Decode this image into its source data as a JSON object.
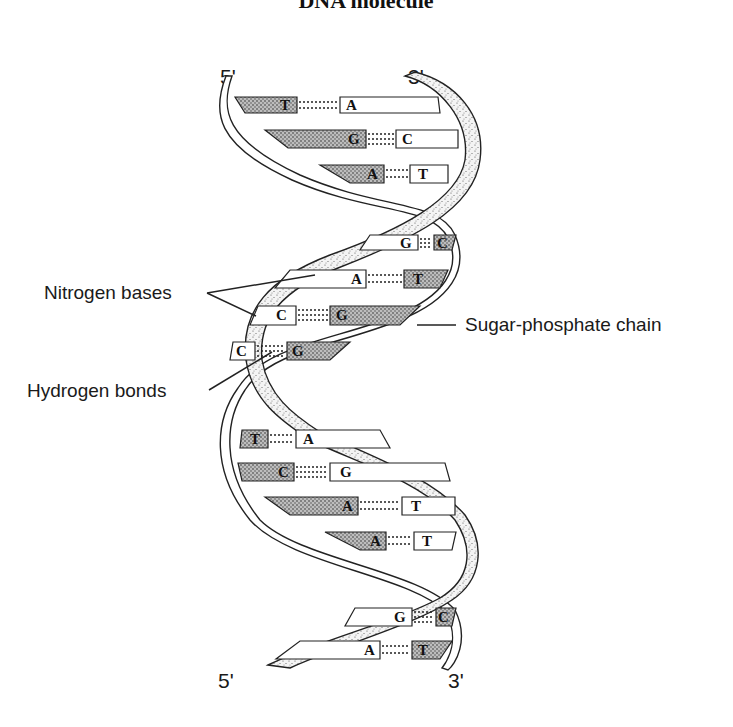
{
  "title": "DNA molecule",
  "ends": {
    "top_left": "5'",
    "top_right": "3'",
    "bottom_left": "5'",
    "bottom_right": "3'"
  },
  "labels": {
    "nitrogen_bases": "Nitrogen bases",
    "hydrogen_bonds": "Hydrogen bonds",
    "sugar_phosphate_chain": "Sugar-phosphate chain"
  },
  "base_pairs": [
    {
      "left": "T",
      "right": "A"
    },
    {
      "left": "G",
      "right": "C"
    },
    {
      "left": "A",
      "right": "T"
    },
    {
      "left": "G",
      "right": "C"
    },
    {
      "left": "A",
      "right": "T"
    },
    {
      "left": "C",
      "right": "G"
    },
    {
      "left": "C",
      "right": "G"
    },
    {
      "left": "T",
      "right": "A"
    },
    {
      "left": "C",
      "right": "G"
    },
    {
      "left": "A",
      "right": "T"
    },
    {
      "left": "A",
      "right": "T"
    },
    {
      "left": "G",
      "right": "C"
    },
    {
      "left": "A",
      "right": "T"
    }
  ]
}
